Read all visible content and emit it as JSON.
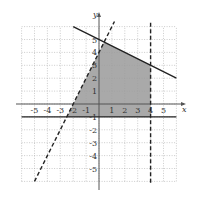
{
  "chart_data": {
    "type": "line",
    "title": "",
    "xlabel": "x",
    "ylabel": "y",
    "xlim": [
      -6,
      6
    ],
    "ylim": [
      -6,
      6
    ],
    "grid": true,
    "x_tick_labels": [
      "-5",
      "-4",
      "-3",
      "-2",
      "-1",
      "1",
      "2",
      "3",
      "4",
      "5"
    ],
    "x_tick_values": [
      -5,
      -4,
      -3,
      -2,
      -1,
      1,
      2,
      3,
      4,
      5
    ],
    "y_tick_labels": [
      "5",
      "4",
      "3",
      "2",
      "1",
      "-1",
      "-2",
      "-3",
      "-4",
      "-5"
    ],
    "y_tick_values": [
      5,
      4,
      3,
      2,
      1,
      -1,
      -2,
      -3,
      -4,
      -5
    ],
    "series": [
      {
        "name": "y = -0.5x + 5",
        "style": "solid",
        "points": [
          [
            -2,
            6
          ],
          [
            6,
            2
          ]
        ]
      },
      {
        "name": "y = 2x + 4",
        "style": "dashed",
        "points": [
          [
            -5,
            -6
          ],
          [
            1.2,
            6.4
          ]
        ]
      },
      {
        "name": "x = 4",
        "style": "dashed",
        "points": [
          [
            4,
            6.3
          ],
          [
            4,
            -6.3
          ]
        ]
      },
      {
        "name": "y = -1",
        "style": "solid",
        "points": [
          [
            -6,
            -1
          ],
          [
            6,
            -1
          ]
        ]
      }
    ],
    "shaded_region": {
      "color": "#9a9a9a",
      "vertices": [
        [
          -2.5,
          -1
        ],
        [
          4,
          -1
        ],
        [
          4,
          3
        ],
        [
          0.4,
          4.8
        ]
      ]
    }
  }
}
